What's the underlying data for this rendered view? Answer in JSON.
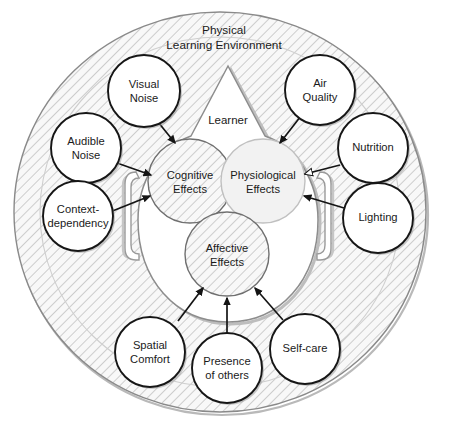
{
  "diagram": {
    "title": "Physical Learning Environment",
    "title_lines": [
      "Physical",
      "Learning Environment"
    ],
    "inner_container_label": "Learner",
    "effects": [
      {
        "id": "cognitive",
        "label_lines": [
          "Cognitive",
          "Effects"
        ],
        "label": "Cognitive Effects",
        "style": "hatched"
      },
      {
        "id": "physiological",
        "label_lines": [
          "Physiological",
          "Effects"
        ],
        "label": "Physiological Effects",
        "style": "plain"
      },
      {
        "id": "affective",
        "label_lines": [
          "Affective",
          "Effects"
        ],
        "label": "Affective Effects",
        "style": "hatched"
      }
    ],
    "factors": [
      {
        "id": "visual-noise",
        "label_lines": [
          "Visual",
          "Noise"
        ],
        "label": "Visual Noise",
        "target": "cognitive"
      },
      {
        "id": "audible-noise",
        "label_lines": [
          "Audible",
          "Noise"
        ],
        "label": "Audible Noise",
        "target": "cognitive"
      },
      {
        "id": "context-dependency",
        "label_lines": [
          "Context-",
          "dependency"
        ],
        "label": "Context-dependency",
        "target": "cognitive"
      },
      {
        "id": "air-quality",
        "label_lines": [
          "Air",
          "Quality"
        ],
        "label": "Air Quality",
        "target": "physiological"
      },
      {
        "id": "nutrition",
        "label_lines": [
          "Nutrition"
        ],
        "label": "Nutrition",
        "target": "physiological"
      },
      {
        "id": "lighting",
        "label_lines": [
          "Lighting"
        ],
        "label": "Lighting",
        "target": "physiological"
      },
      {
        "id": "spatial-comfort",
        "label_lines": [
          "Spatial",
          "Comfort"
        ],
        "label": "Spatial Comfort",
        "target": "affective"
      },
      {
        "id": "presence-of-others",
        "label_lines": [
          "Presence",
          "of others"
        ],
        "label": "Presence of others",
        "target": "affective"
      },
      {
        "id": "self-care",
        "label_lines": [
          "Self-care"
        ],
        "label": "Self-care",
        "target": "affective"
      }
    ],
    "colors": {
      "background": "#ffffff",
      "hatch_line": "#b0b0b0",
      "hatch_fill": "#f7f7f7",
      "node_stroke": "#161616",
      "soft_stroke": "#8d8d8d",
      "text": "#1a1a1a",
      "arrow": "#141414"
    }
  }
}
